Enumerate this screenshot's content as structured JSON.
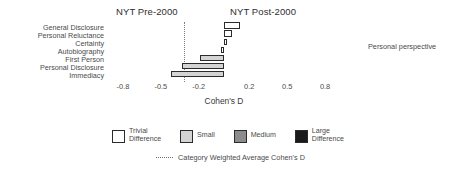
{
  "panels": {
    "left_title": "NYT Pre-2000",
    "right_title": "NYT Post-2000"
  },
  "side_note": "Personal perspective",
  "axis": {
    "xlabel": "Cohen's D",
    "ticks": [
      "-0.8",
      "-0.5",
      "-0.2",
      "0.2",
      "0.5",
      "0.8"
    ]
  },
  "legend": {
    "items": [
      {
        "label": "Trivial\nDifference",
        "color": "#ffffff"
      },
      {
        "label": "Small",
        "color": "#d4d4d4"
      },
      {
        "label": "Medium",
        "color": "#8c8c8c"
      },
      {
        "label": "Large\nDifference",
        "color": "#1a1a1a"
      }
    ],
    "average_line_label": "Category Weighted Average Cohen's D"
  },
  "chart_data": {
    "type": "bar",
    "orientation": "horizontal",
    "xlabel": "Cohen's D",
    "ylabel": "",
    "xlim": [
      -0.95,
      0.95
    ],
    "xticks": [
      -0.8,
      -0.5,
      -0.2,
      0.2,
      0.5,
      0.8
    ],
    "grid": false,
    "legend_position": "bottom",
    "categories": [
      "General Disclosure",
      "Personal Reluctance",
      "Certainty",
      "Autobiography",
      "First Person",
      "Personal Disclosure",
      "Immediacy"
    ],
    "values": [
      0.13,
      0.06,
      0.02,
      -0.02,
      -0.19,
      -0.33,
      -0.42
    ],
    "effect_sizes": [
      "Trivial",
      "Trivial",
      "Trivial",
      "Trivial",
      "Small",
      "Small",
      "Small"
    ],
    "bar_colors": [
      "#ffffff",
      "#ffffff",
      "#ffffff",
      "#ffffff",
      "#d4d4d4",
      "#d4d4d4",
      "#d4d4d4"
    ],
    "annotations": [
      {
        "type": "vline",
        "value": -0.32,
        "style": "dotted",
        "label": "Category Weighted Average Cohen's D"
      }
    ]
  }
}
